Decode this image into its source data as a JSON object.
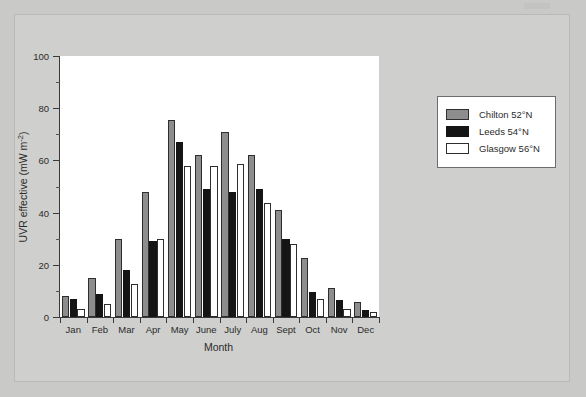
{
  "chart_data": {
    "type": "bar",
    "title": "",
    "xlabel": "Month",
    "ylabel_parts": {
      "main": "UVR effective (mW m",
      "exponent": "-2",
      "tail": ")"
    },
    "ylabel": "UVR effective (mW m-2)",
    "categories": [
      "Jan",
      "Feb",
      "Mar",
      "Apr",
      "May",
      "June",
      "July",
      "Aug",
      "Sept",
      "Oct",
      "Nov",
      "Dec"
    ],
    "series": [
      {
        "name": "Chilton 52°N",
        "color": "#8d8d8d",
        "values": [
          8,
          15,
          30,
          48,
          75.5,
          62,
          71,
          62,
          41,
          22.5,
          11,
          5.9
        ]
      },
      {
        "name": "Leeds 54°N",
        "color": "#151515",
        "values": [
          6.8,
          9,
          18,
          29,
          67,
          49,
          48,
          49,
          30,
          9.5,
          6.5,
          2.5
        ]
      },
      {
        "name": "Glasgow 56°N",
        "color": "#ffffff",
        "values": [
          2.9,
          5,
          12.5,
          30,
          58,
          58,
          58.5,
          43.5,
          28,
          7,
          3,
          2
        ]
      }
    ],
    "ylim": [
      0,
      100
    ],
    "yticks": [
      0,
      20,
      40,
      60,
      80,
      100
    ],
    "yticks_minor": [
      10,
      30,
      50,
      70,
      90
    ],
    "grid": false,
    "legend_position": "right"
  },
  "legend": {
    "items": [
      {
        "label": "Chilton 52°N",
        "swatch": "chilton"
      },
      {
        "label": "Leeds 54°N",
        "swatch": "leeds"
      },
      {
        "label": "Glasgow 56°N",
        "swatch": "glasgow"
      }
    ]
  },
  "colors": {
    "background": "#c9c9c7",
    "plot_background": "#ffffff",
    "axis": "#3a3a3a",
    "chilton": "#8d8d8d",
    "leeds": "#151515",
    "glasgow": "#ffffff"
  }
}
